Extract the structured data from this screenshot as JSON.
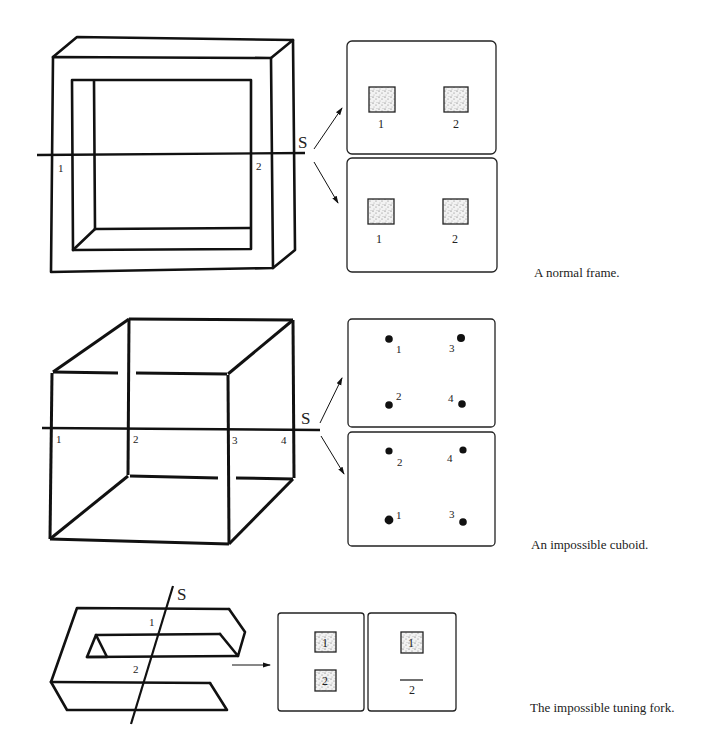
{
  "figures": [
    {
      "id": "normal-frame",
      "caption": "A normal frame.",
      "section_label": "S",
      "intersection_labels": [
        "1",
        "2"
      ],
      "views": [
        {
          "markers": [
            {
              "label": "1",
              "shape": "stippled-square"
            },
            {
              "label": "2",
              "shape": "stippled-square"
            }
          ]
        },
        {
          "markers": [
            {
              "label": "1",
              "shape": "stippled-square"
            },
            {
              "label": "2",
              "shape": "stippled-square"
            }
          ]
        }
      ]
    },
    {
      "id": "impossible-cuboid",
      "caption": "An impossible cuboid.",
      "section_label": "S",
      "intersection_labels": [
        "1",
        "2",
        "3",
        "4"
      ],
      "views": [
        {
          "markers": [
            {
              "label": "1",
              "shape": "dot"
            },
            {
              "label": "3",
              "shape": "dot"
            },
            {
              "label": "2",
              "shape": "dot"
            },
            {
              "label": "4",
              "shape": "dot"
            }
          ]
        },
        {
          "markers": [
            {
              "label": "2",
              "shape": "dot"
            },
            {
              "label": "4",
              "shape": "dot"
            },
            {
              "label": "1",
              "shape": "dot"
            },
            {
              "label": "3",
              "shape": "dot"
            }
          ]
        }
      ]
    },
    {
      "id": "impossible-tuning-fork",
      "caption": "The impossible tuning fork.",
      "section_label": "S",
      "intersection_labels": [
        "1",
        "2"
      ],
      "views": [
        {
          "markers": [
            {
              "label": "1",
              "shape": "stippled-square"
            },
            {
              "label": "2",
              "shape": "stippled-square"
            }
          ]
        },
        {
          "markers": [
            {
              "label": "1",
              "shape": "stippled-square"
            },
            {
              "label": "2",
              "shape": "line"
            }
          ]
        }
      ]
    }
  ]
}
